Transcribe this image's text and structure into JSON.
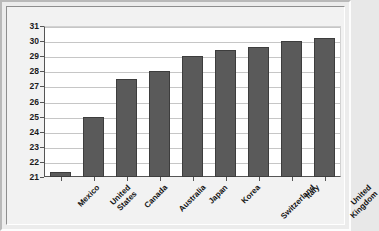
{
  "chart_data": {
    "type": "bar",
    "title": "",
    "subtitle": "",
    "xlabel": "",
    "ylabel": "",
    "ylim": [
      21,
      31
    ],
    "yticks": [
      21,
      22,
      23,
      24,
      25,
      26,
      27,
      28,
      29,
      30,
      31
    ],
    "grid": true,
    "legend": false,
    "legend_position": "none",
    "categories": [
      "Mexico",
      "United States",
      "Canada",
      "Australia",
      "Japan",
      "Korea",
      "Switzerland",
      "Italy",
      "United Kingdom"
    ],
    "category_lines": [
      [
        "Mexico"
      ],
      [
        "United",
        "States"
      ],
      [
        "Canada"
      ],
      [
        "Australia"
      ],
      [
        "Japan"
      ],
      [
        "Korea"
      ],
      [
        "Switzerland"
      ],
      [
        "Italy"
      ],
      [
        "United",
        "Kingdom"
      ]
    ],
    "values": [
      21.3,
      25.0,
      27.5,
      28.0,
      29.0,
      29.4,
      29.6,
      30.0,
      30.2
    ],
    "colors": {
      "bar_fill": "#5a5a5a",
      "bar_border": "#3d3d3d",
      "plot_background": "#ffffff",
      "gridline": "#c6c6c6",
      "axis": "#555555",
      "frame_background": "#ececec",
      "text": "#111111"
    }
  }
}
